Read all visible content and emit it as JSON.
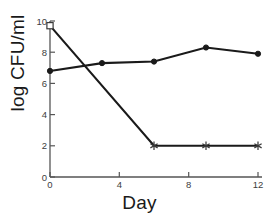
{
  "chart_data": {
    "type": "line",
    "title": "",
    "subtitle": "",
    "xlabel": "Day",
    "ylabel": "log CFU/ml",
    "xlim": [
      0,
      12
    ],
    "ylim": [
      0,
      10
    ],
    "xticks": [
      0,
      4,
      8,
      12
    ],
    "xtick_labels": [
      "0",
      "4",
      "8",
      "12"
    ],
    "yticks": [
      0,
      2,
      4,
      6,
      8,
      10
    ],
    "ytick_labels": [
      "0",
      "2",
      "4",
      "6",
      "8",
      "10"
    ],
    "grid": false,
    "legend": "none",
    "background_color": "#ffffff",
    "line_color": "#1a1a1a",
    "axis_color": "#555555",
    "series": [
      {
        "name": "filled-circle-series",
        "marker": "filled-circle",
        "x": [
          0,
          3,
          6,
          9,
          12
        ],
        "values": [
          6.8,
          7.3,
          7.4,
          8.3,
          7.9
        ]
      },
      {
        "name": "open-square-asterisk-series",
        "marker": "open-square-then-asterisk",
        "x": [
          0,
          6,
          9,
          12
        ],
        "values": [
          9.7,
          2.0,
          2.0,
          2.0
        ],
        "marker_per_point": [
          "open-square",
          "asterisk",
          "asterisk",
          "asterisk"
        ]
      }
    ]
  },
  "axes": {
    "x_title": "Day",
    "y_title": "log CFU/ml"
  }
}
